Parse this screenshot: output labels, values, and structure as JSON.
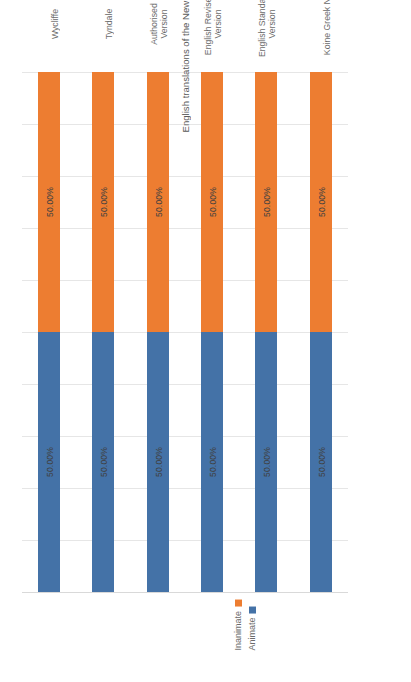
{
  "chart_data": {
    "type": "bar",
    "subtype": "100% stacked bar (horizontal), rotated 90 degrees",
    "title": "",
    "xlabel": "English translations of the New Testament (and the Koine Greek NT)",
    "ylabel": "Animate vs inanimate subjects (Percentages)",
    "categories": [
      "Wycliffe",
      "Tyndale",
      "Authorised\nVersion",
      "English Revised\nVersion",
      "English Standard\nVersion",
      "Koine Greek NT"
    ],
    "series": [
      {
        "name": "Animate",
        "color": "#4472A7",
        "values": [
          50.0,
          50.0,
          50.0,
          50.0,
          50.0,
          50.0
        ],
        "labels": [
          "50.00%",
          "50.00%",
          "50.00%",
          "50.00%",
          "50.00%",
          "50.00%"
        ]
      },
      {
        "name": "Inanimate",
        "color": "#ED7D31",
        "values": [
          50.0,
          50.0,
          50.0,
          50.0,
          50.0,
          50.0
        ],
        "labels": [
          "50.00%",
          "50.00%",
          "50.00%",
          "50.00%",
          "50.00%",
          "50.00%"
        ]
      }
    ],
    "ylim": [
      0,
      100
    ],
    "yticks": [
      0,
      10,
      20,
      30,
      40,
      50,
      60,
      70,
      80,
      90,
      100
    ],
    "ytick_labels": [
      "0%",
      "10%",
      "20%",
      "30%",
      "40%",
      "50%",
      "60%",
      "70%",
      "80%",
      "90%",
      "100%"
    ],
    "grid": true,
    "grid_color": "#E6E6E6",
    "legend_position": "top",
    "legend_entries": [
      "Inanimate",
      "Animate"
    ],
    "background": "#FFFFFF"
  }
}
